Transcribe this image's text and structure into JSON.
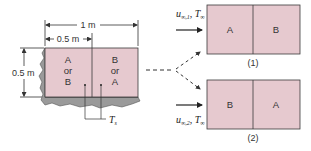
{
  "dimensions": {
    "total_width": "1 m",
    "half_width": "0.5 m",
    "height": "0.5 m"
  },
  "left_block": {
    "left_cell": {
      "line1": "A",
      "line2": "or",
      "line3": "B"
    },
    "right_cell": {
      "line1": "B",
      "line2": "or",
      "line3": "A"
    },
    "surface_temp_label": "T",
    "surface_temp_sub": "s"
  },
  "config1": {
    "label": "(1)",
    "left_cell": "A",
    "right_cell": "B",
    "flow": {
      "u": "u",
      "u_sub": "∞,1",
      "T": "T",
      "T_sub": "∞"
    }
  },
  "config2": {
    "label": "(2)",
    "left_cell": "B",
    "right_cell": "A",
    "flow": {
      "u": "u",
      "u_sub": "∞,2",
      "T": "T",
      "T_sub": "∞"
    }
  },
  "colors": {
    "plate_fill": "#e6c9cf",
    "base_fill": "#9a9a9a",
    "outline": "#3a3a3a"
  }
}
